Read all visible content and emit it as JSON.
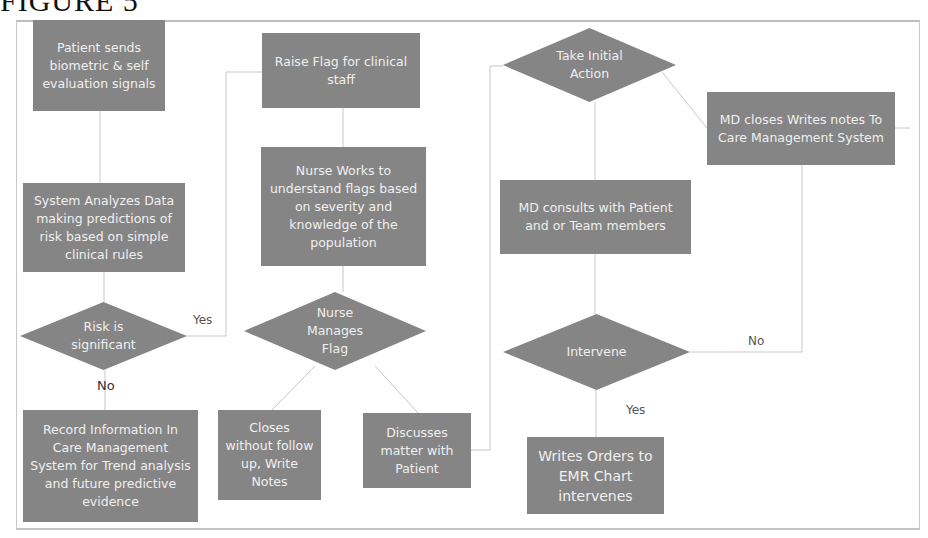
{
  "figure": {
    "title": "FIGURE 5"
  },
  "colors": {
    "node_fill": "#858585",
    "node_text": "#f0f0f0",
    "connector": "#c8c8c8",
    "frame": "#c9c9c9"
  },
  "nodes": {
    "patient_sends": "Patient sends biometric & self evaluation signals",
    "system_analyzes": "System Analyzes Data making predictions of risk based on simple clinical rules",
    "risk_significant": "Risk is significant",
    "record_information": "Record Information In Care Management System for Trend analysis and future predictive evidence",
    "raise_flag": "Raise Flag for clinical staff",
    "nurse_works": "Nurse Works to understand flags based on severity and knowledge of the population",
    "nurse_manages": "Nurse Manages Flag",
    "closes_without": "Closes without follow up, Write Notes",
    "discusses_matter": "Discusses matter with Patient",
    "take_initial_action": "Take Initial Action",
    "md_closes": "MD closes Writes notes To Care Management System",
    "md_consults": "MD consults with Patient and or Team members",
    "intervene": "Intervene",
    "writes_orders": "Writes Orders to EMR Chart intervenes"
  },
  "labels": {
    "risk_yes": "Yes",
    "risk_no": "No",
    "intervene_no": "No",
    "intervene_yes": "Yes"
  }
}
